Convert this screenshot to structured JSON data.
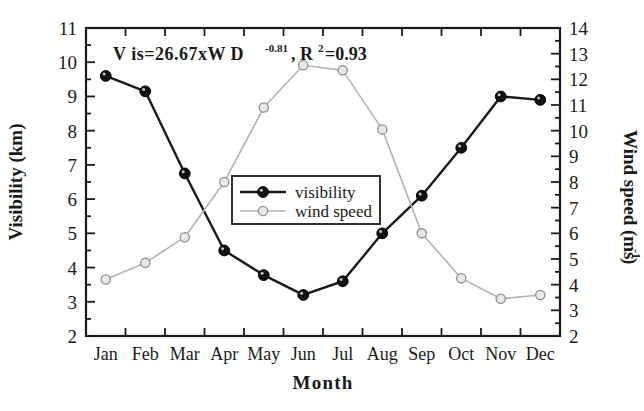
{
  "chart_data": {
    "type": "line",
    "title": "",
    "annotation": "Vis=26.67xWD-0.81, R2=0.93",
    "annotation_parts": {
      "prefix": "V is=26.67xW D",
      "exponent": "-0.81",
      "middle": ", R",
      "sup2": "2",
      "suffix": "=0.93"
    },
    "xlabel": "Month",
    "categories": [
      "Jan",
      "Feb",
      "Mar",
      "Apr",
      "May",
      "Jun",
      "Jul",
      "Aug",
      "Sep",
      "Oct",
      "Nov",
      "Dec"
    ],
    "grid": false,
    "legend_position": "center",
    "axes": {
      "left": {
        "label": "Visibility (km)",
        "ylim": [
          2,
          11
        ],
        "ticks": [
          2,
          3,
          4,
          5,
          6,
          7,
          8,
          9,
          10,
          11
        ],
        "minor_tick_interval": 0.5
      },
      "right": {
        "label_main": "Wind speed (ms",
        "label_sup": "-1",
        "label_tail": ")",
        "label": "Wind speed (ms-1)",
        "ylim": [
          2,
          14
        ],
        "ticks": [
          2,
          3,
          4,
          5,
          6,
          7,
          8,
          9,
          10,
          11,
          12,
          13,
          14
        ],
        "minor_tick_interval": 0.5
      }
    },
    "series": [
      {
        "name": "visibility",
        "axis": "left",
        "color": "#1a1a1a",
        "marker": "filled-circle",
        "marker_fill": "#111111",
        "values": [
          9.6,
          9.15,
          6.75,
          4.5,
          3.78,
          3.2,
          3.6,
          5.0,
          6.1,
          7.5,
          9.0,
          8.9
        ]
      },
      {
        "name": "wind speed",
        "axis": "right",
        "color": "#b4b4b4",
        "marker": "open-circle",
        "marker_fill": "#e8e8e8",
        "values": [
          4.2,
          4.85,
          5.85,
          8.0,
          10.9,
          12.55,
          12.35,
          10.05,
          6.0,
          4.25,
          3.45,
          3.6
        ]
      }
    ],
    "legend": [
      {
        "label": "visibility",
        "color": "#1a1a1a",
        "marker_fill": "#111111"
      },
      {
        "label": "wind speed",
        "color": "#b4b4b4",
        "marker_fill": "#e8e8e8"
      }
    ]
  }
}
